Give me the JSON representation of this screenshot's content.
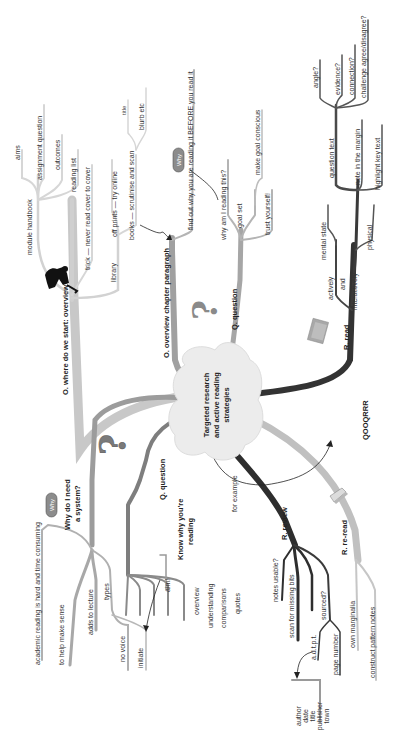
{
  "diagram": {
    "type": "mind-map",
    "orientation": "rotated-90-ccw",
    "center": {
      "line1": "Targeted research",
      "line2": "and active reading",
      "line3": "strategies"
    },
    "colors": {
      "branch_light": "#c8c8c8",
      "branch_mid": "#9a9a9a",
      "branch_dark": "#4a4a4a",
      "branch_black": "#2e2e2e",
      "cloud": "#ececec",
      "badge": "#8c8c8c"
    },
    "branches": {
      "overview": {
        "label": "O. where do we start: overview",
        "children": {
          "module_handbook": "module handbook",
          "aims": "aims",
          "assignment_question": "assignment question",
          "outcomes": "outcomes",
          "reading_list": "reading list",
          "trick": "trick — never read cover to cover",
          "library": "library",
          "off_prints": "off prints — try online",
          "books": "books — scrutinise and scan",
          "title": "title",
          "blurb": "blurb etc"
        }
      },
      "overview_chapter": {
        "label": "O. overview chapter paragraph",
        "why_badge": "Why",
        "find_out": "find out why you are reading it BEFORE you read it"
      },
      "question_upper": {
        "label": "Q. question",
        "children": {
          "why_reading": "why am I reading this?",
          "goal_set": "goal set",
          "make_goal_conscious": "make goal conscious",
          "trust_yourself": "trust yourself!"
        }
      },
      "read": {
        "label": "R. read",
        "children": {
          "actively": "actively",
          "and": "and",
          "interactively": "interactively",
          "mental_state": "mental state",
          "physical": "physical",
          "question_text": "question text",
          "angle": "angle?",
          "evidence": "evidence?",
          "connection": "connection?",
          "challenge": "challenge agree/disagree?",
          "note_margin": "note in the margin",
          "highlight": "highlight key text"
        }
      },
      "qooqrrr": "QOOQRRR",
      "why_system": {
        "why_badge": "Why",
        "label_line1": "Why do I need",
        "label_line2": "a system?",
        "children": {
          "academic_reading": "academic reading is hard and time consuming",
          "help_sense": "to help make sense",
          "adds_lecture": "adds to lecture",
          "types": "types",
          "no_voice": "no voice",
          "initiate": "initiate",
          "aim": "aim!"
        }
      },
      "question_lower": {
        "label": "Q. question",
        "know_line1": "Know why you're",
        "know_line2": "reading",
        "children": {
          "overview": "overview",
          "understanding": "understanding",
          "comparisons": "comparisons",
          "quotes": "quotes"
        }
      },
      "for_example": "for example",
      "review": {
        "label": "R. review",
        "children": {
          "notes_usable": "notes usable?",
          "scan_missing": "scan for missing bits",
          "sourced": "sourced?",
          "adtpt": "a.d.t.p.t.",
          "page_number": "page number"
        },
        "source_box": [
          "author",
          "date",
          "title",
          "publisher",
          "town"
        ]
      },
      "reread": {
        "label": "R. re-read",
        "children": {
          "own_marginalia": "own marginalia",
          "construct_notes": "construct pattern notes"
        }
      }
    },
    "icons": [
      "person-silhouette-icon",
      "question-mark-icon",
      "question-mark-icon",
      "book-icon",
      "open-book-icon"
    ]
  }
}
